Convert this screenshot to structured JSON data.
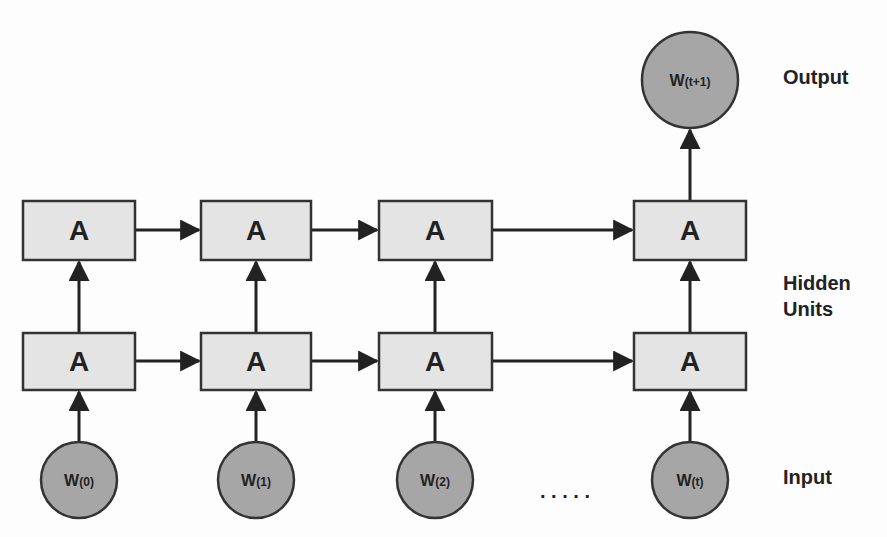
{
  "diagram": {
    "type": "unrolled-rnn",
    "layer_labels": {
      "output": "Output",
      "hidden_line1": "Hidden",
      "hidden_line2": "Units",
      "input": "Input"
    },
    "hidden_unit_label": "A",
    "ellipsis": ". . . . .",
    "inputs": [
      {
        "label_main": "W",
        "label_sub": "(0)"
      },
      {
        "label_main": "W",
        "label_sub": "(1)"
      },
      {
        "label_main": "W",
        "label_sub": "(2)"
      },
      {
        "label_main": "W",
        "label_sub": "(t)"
      }
    ],
    "output": {
      "label_main": "W",
      "label_sub": "(t+1)"
    },
    "colors": {
      "box_fill": "#e4e4e4",
      "circle_fill": "#a6a6a6",
      "stroke": "#333333"
    }
  }
}
